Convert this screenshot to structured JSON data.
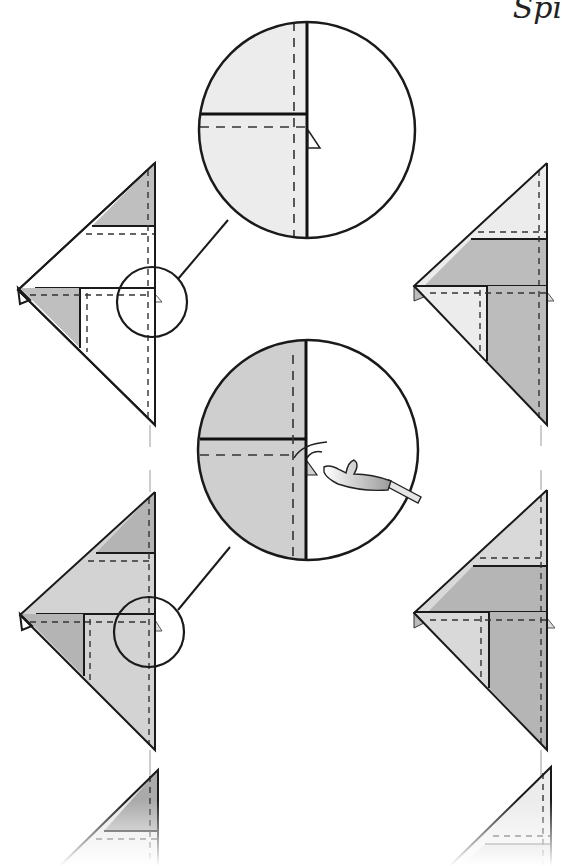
{
  "page": {
    "header_text": "Spi",
    "background": "#ffffff"
  },
  "colors": {
    "light_paper": "#ececec",
    "dark_paper": "#bcbcbc",
    "mid_paper": "#d2d2d2",
    "line": "#1a1a1a",
    "tool_handle": "#e6e6e6"
  },
  "diagrams": [
    {
      "id": "step-a",
      "position": "top-left",
      "description": "Folded kite shape with magnified detail circle",
      "has_magnifier": true
    },
    {
      "id": "magnifier-a",
      "position": "top-center",
      "description": "Enlarged view: edge with small triangle flap"
    },
    {
      "id": "step-b",
      "position": "top-right",
      "description": "Result after fold, dark band in middle"
    },
    {
      "id": "magnifier-b",
      "position": "middle-center",
      "description": "Enlarged view: hook tool pulling out hidden paper flap"
    },
    {
      "id": "step-c",
      "position": "middle-left",
      "description": "Folded kite shape with magnified detail circle (gray)",
      "has_magnifier": true
    },
    {
      "id": "step-d",
      "position": "middle-right",
      "description": "Result after pulling flap"
    },
    {
      "id": "step-e",
      "position": "bottom-left",
      "description": "Next step (partially visible)"
    },
    {
      "id": "step-f",
      "position": "bottom-right",
      "description": "Next step result (partially visible)"
    }
  ],
  "tool": {
    "name": "crochet-hook",
    "description": "Hook tool used to pull paper"
  }
}
